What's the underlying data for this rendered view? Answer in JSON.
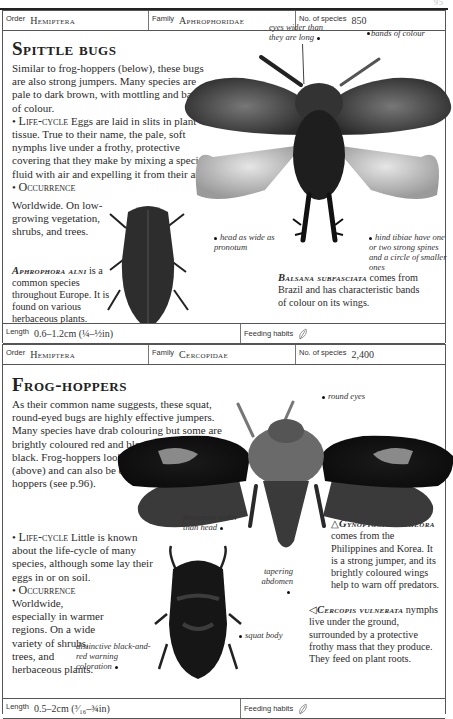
{
  "page_header": {
    "page_number": "95"
  },
  "entries": [
    {
      "order_label": "Order",
      "order": "Hemiptera",
      "family_label": "Family",
      "family": "Aphrophoridae",
      "species_label": "No. of species",
      "species_count": "850",
      "title": "Spittle bugs",
      "intro": "Similar to frog-hoppers (below), these bugs are also strong jumpers. Many species are pale to dark brown, with mottling and bands of colour.",
      "lifecycle_label": "Life-cycle",
      "lifecycle_text": "Eggs are laid in slits in plant tissue. True to their name, the pale, soft nymphs live under a frothy, protective covering that they make by mixing a special fluid with air and expelling it from their anus.",
      "occurrence_label": "Occurrence",
      "occurrence_text": "Worldwide. On low-growing vegetation, shrubs, and trees.",
      "species_notes": [
        {
          "name": "Aphrophora alni",
          "text": "is a common species throughout Europe. It is found on various herbaceous plants."
        },
        {
          "name": "Balsana subfasciata",
          "text": "comes from Brazil and has characteristic bands of colour on its wings."
        }
      ],
      "annotations": [
        "eyes wider than they are long",
        "bands of colour",
        "head as wide as pronotum",
        "hind tibiae have one or two strong spines and a circle of smaller ones"
      ],
      "length_label": "Length",
      "length": "0.6–1.2cm (¼–½in)",
      "feeding_label": "Feeding habits",
      "feeding_icon": "leaf-icon"
    },
    {
      "order_label": "Order",
      "order": "Hemiptera",
      "family_label": "Family",
      "family": "Cercopidae",
      "species_label": "No. of species",
      "species_count": "2,400",
      "title": "Frog-hoppers",
      "intro": "As their common name suggests, these squat, round-eyed bugs are highly effective jumpers. Many species have drab colouring but some are brightly coloured red and black or yellow and black. Frog-hoppers look similar to spittle bugs (above) and can also be confused with leaf-hoppers (see p.96).",
      "lifecycle_label": "Life-cycle",
      "lifecycle_text": "Little is known about the life-cycle of many species, although some lay their eggs in or on soil.",
      "occurrence_label": "Occurrence",
      "occurrence_text": "Worldwide, especially in warmer regions. On a wide variety of shrubs, trees, and herbaceous plants.",
      "species_notes": [
        {
          "marker": "△",
          "name": "Gynopygoplax theora",
          "text": "comes from the Philippines and Korea. It is a strong jumper, and its brightly coloured wings help to warn off predators."
        },
        {
          "marker": "◁",
          "name": "Cercopis vulnerata",
          "text": "nymphs live under the ground, surrounded by a protective frothy mass that they produce. They feed on plant roots."
        }
      ],
      "annotations": [
        "round eyes",
        "pronotum wider than head",
        "tapering abdomen",
        "squat body",
        "distinctive black-and-red warning coloration"
      ],
      "length_label": "Length",
      "length": "0.5–2cm (³⁄₁₆–¾in)",
      "feeding_label": "Feeding habits",
      "feeding_icon": "leaf-icon"
    }
  ]
}
